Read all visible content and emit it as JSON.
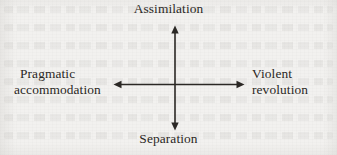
{
  "diagram": {
    "type": "two-axis cross diagram",
    "background_color": "#f2f1ef",
    "line_color": "#2b2825",
    "text_color": "#2a2724",
    "axes": {
      "vertical": {
        "top_label": "Assimilation",
        "bottom_label": "Separation",
        "x": 175,
        "y_top": 26,
        "y_bottom": 130,
        "arrowheads": [
          "top",
          "bottom"
        ]
      },
      "horizontal": {
        "left_label_line_1": "Pragmatic",
        "left_label_line_2": "accommodation",
        "right_label_line_1": "Violent",
        "right_label_line_2": "revolution",
        "y": 84,
        "x_left": 114,
        "x_right": 244,
        "arrowheads": [
          "left",
          "right"
        ]
      }
    },
    "labels": {
      "top": "Assimilation",
      "bottom": "Separation",
      "left_line_1": "Pragmatic",
      "left_line_2": "accommodation",
      "right_line_1": "Violent",
      "right_line_2": "revolution"
    }
  }
}
